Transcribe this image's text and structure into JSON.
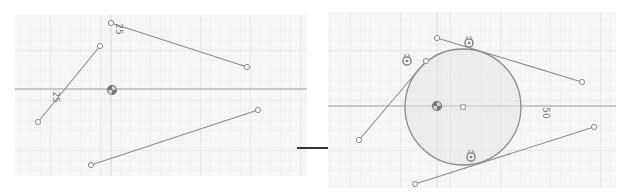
{
  "diagram": {
    "colors": {
      "background": "#ffffff",
      "grid_fill": "#f5f5f5",
      "grid_line": "#e2e2e2",
      "axis": "#9a9a9a",
      "segment": "#8a8a8a",
      "circle_stroke": "#8c8c8c",
      "circle_fill": "#e4e4e4",
      "arrow": "#333333",
      "endpoint": "#ffffff"
    },
    "before_panel": {
      "label": "before",
      "bounds": {
        "x": 15,
        "y": 15,
        "w": 292,
        "h": 161
      },
      "axis_horizontal_y": 89,
      "axis_vertical_x": 111,
      "origin_icon": {
        "x": 112,
        "y": 90
      },
      "segments": [
        {
          "id": "A",
          "x1": 111,
          "y1": 23,
          "x2": 247,
          "y2": 67
        },
        {
          "id": "B",
          "x1": 100,
          "y1": 46,
          "x2": 38,
          "y2": 122
        },
        {
          "id": "C",
          "x1": 258,
          "y1": 110,
          "x2": 91,
          "y2": 165
        }
      ],
      "dimension_labels": [
        {
          "text": "25",
          "x": 116,
          "y": 29,
          "rotate": 90
        },
        {
          "text": "25",
          "x": 53,
          "y": 97,
          "rotate": 90
        }
      ]
    },
    "arrow": {
      "x1": 297,
      "y1": 148,
      "x2": 344,
      "y2": 148,
      "label": "transforms to"
    },
    "after_panel": {
      "label": "after",
      "bounds": {
        "x": 328,
        "y": 12,
        "w": 288,
        "h": 176
      },
      "axis_horizontal_y": 106,
      "axis_vertical_x": 437,
      "origin_icon": {
        "x": 437,
        "y": 106
      },
      "circle": {
        "cx": 463,
        "cy": 107,
        "r": 58
      },
      "center_point": {
        "x": 463,
        "y": 107
      },
      "segments": [
        {
          "id": "A",
          "x1": 437,
          "y1": 38,
          "x2": 582,
          "y2": 82
        },
        {
          "id": "B",
          "x1": 426,
          "y1": 61,
          "x2": 359,
          "y2": 140
        },
        {
          "id": "C",
          "x1": 594,
          "y1": 127,
          "x2": 415,
          "y2": 184
        }
      ],
      "tangent_icons": [
        {
          "x": 469,
          "y": 43
        },
        {
          "x": 407,
          "y": 61
        },
        {
          "x": 471,
          "y": 157
        }
      ],
      "dimension_labels": [
        {
          "text": "50",
          "x": 543,
          "y": 113,
          "rotate": 90
        }
      ]
    }
  }
}
